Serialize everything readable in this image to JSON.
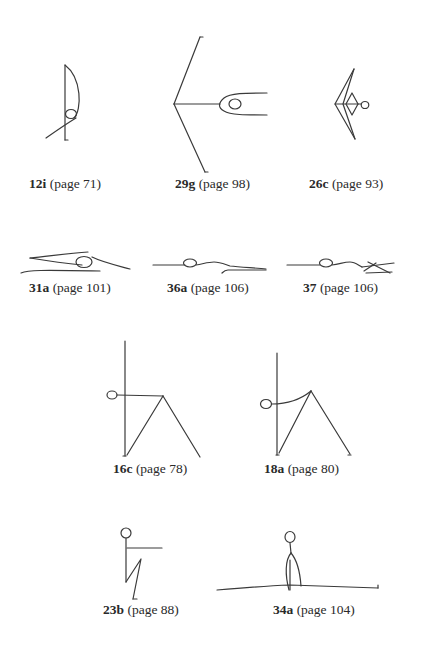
{
  "figures": [
    {
      "id": "12i",
      "code": "12i",
      "ref": "(page 71)",
      "page": 71
    },
    {
      "id": "29g",
      "code": "29g",
      "ref": "(page 98)",
      "page": 98
    },
    {
      "id": "26c",
      "code": "26c",
      "ref": "(page 93)",
      "page": 93
    },
    {
      "id": "31a",
      "code": "31a",
      "ref": "(page 101)",
      "page": 101
    },
    {
      "id": "36a",
      "code": "36a",
      "ref": "(page 106)",
      "page": 106
    },
    {
      "id": "37",
      "code": "37",
      "ref": "(page 106)",
      "page": 106
    },
    {
      "id": "16c",
      "code": "16c",
      "ref": "(page 78)",
      "page": 78
    },
    {
      "id": "18a",
      "code": "18a",
      "ref": "(page 80)",
      "page": 80
    },
    {
      "id": "23b",
      "code": "23b",
      "ref": "(page 88)",
      "page": 88
    },
    {
      "id": "34a",
      "code": "34a",
      "ref": "(page 104)",
      "page": 104
    }
  ]
}
